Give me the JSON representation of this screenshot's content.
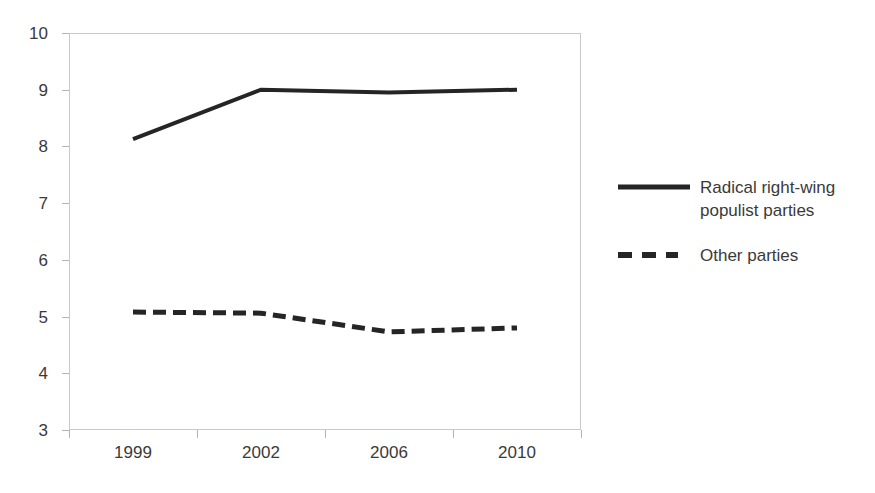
{
  "chart_data": {
    "type": "line",
    "title": "",
    "xlabel": "",
    "ylabel": "",
    "categories": [
      "1999",
      "2002",
      "2006",
      "2010"
    ],
    "ylim": [
      3,
      10
    ],
    "yticks": [
      "3",
      "4",
      "5",
      "6",
      "7",
      "8",
      "9",
      "10"
    ],
    "grid": false,
    "legend_position": "right",
    "series": [
      {
        "name": "Radical right-wing populist parties",
        "style": "solid",
        "color": "#252525",
        "values": [
          8.13,
          9.0,
          8.95,
          9.0
        ]
      },
      {
        "name": "Other parties",
        "style": "dashed",
        "color": "#252525",
        "values": [
          5.08,
          5.06,
          4.73,
          4.8
        ]
      }
    ]
  },
  "legend": {
    "entries": [
      {
        "label": "Radical right-wing populist parties",
        "swatch": "solid-line-swatch"
      },
      {
        "label": "Other parties",
        "swatch": "dashed-line-swatch"
      }
    ]
  },
  "colors": {
    "series_line": "#252525",
    "axis_line": "#c9c9c9",
    "tick_mark": "#b4b4b4",
    "text": "#3a3a3a",
    "background": "#ffffff"
  }
}
